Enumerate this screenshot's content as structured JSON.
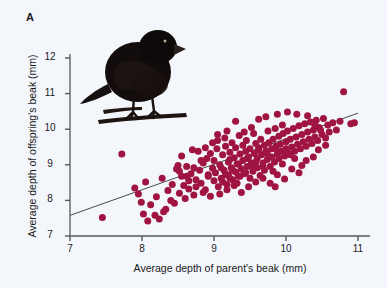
{
  "figure": {
    "panel_label": "A",
    "background_color": "#f3f6fa",
    "point_color": "#a01442",
    "line_color": "#4a4a52",
    "axis_color": "#58585f"
  },
  "photo": {
    "subject": "black darwins finch perched on branch",
    "alt": "Darwin's finch",
    "body_color": "#120d0c",
    "branch_color": "#1d1411"
  },
  "chart_data": {
    "type": "scatter",
    "title": "",
    "xlabel": "Average depth of parent's beak (mm)",
    "ylabel": "Average depth of offspring's beak (mm)",
    "xlim": [
      7,
      11
    ],
    "ylim": [
      7,
      12
    ],
    "xticks": [
      7,
      8,
      9,
      10,
      11
    ],
    "yticks": [
      7,
      8,
      9,
      10,
      11,
      12
    ],
    "xtick_labels": [
      "7",
      "8",
      "9",
      "10",
      "11"
    ],
    "ytick_labels": [
      "7",
      "8",
      "9",
      "10",
      "11",
      "12"
    ],
    "grid": false,
    "legend": null,
    "marker_size": 4.6,
    "trendline": {
      "type": "linear",
      "x": [
        7.0,
        11.0
      ],
      "y": [
        7.58,
        10.45
      ],
      "slope": 0.7175,
      "intercept": 2.5575
    },
    "points": [
      [
        7.45,
        7.52
      ],
      [
        7.72,
        9.3
      ],
      [
        7.9,
        8.35
      ],
      [
        7.95,
        8.18
      ],
      [
        7.99,
        7.95
      ],
      [
        8.02,
        7.62
      ],
      [
        8.05,
        8.52
      ],
      [
        8.08,
        7.42
      ],
      [
        8.12,
        7.88
      ],
      [
        8.18,
        7.58
      ],
      [
        8.2,
        8.1
      ],
      [
        8.24,
        7.48
      ],
      [
        8.28,
        8.62
      ],
      [
        8.3,
        7.68
      ],
      [
        8.33,
        7.75
      ],
      [
        8.36,
        8.28
      ],
      [
        8.4,
        8.0
      ],
      [
        8.42,
        8.45
      ],
      [
        8.45,
        7.92
      ],
      [
        8.48,
        8.88
      ],
      [
        8.5,
        8.98
      ],
      [
        8.52,
        8.2
      ],
      [
        8.55,
        9.25
      ],
      [
        8.58,
        8.42
      ],
      [
        8.6,
        8.05
      ],
      [
        8.62,
        8.95
      ],
      [
        8.65,
        8.32
      ],
      [
        8.68,
        8.75
      ],
      [
        8.7,
        9.42
      ],
      [
        8.72,
        8.15
      ],
      [
        8.75,
        8.58
      ],
      [
        8.78,
        9.38
      ],
      [
        8.8,
        8.85
      ],
      [
        8.82,
        8.48
      ],
      [
        8.85,
        9.05
      ],
      [
        8.88,
        8.3
      ],
      [
        8.9,
        9.18
      ],
      [
        8.92,
        8.68
      ],
      [
        8.95,
        9.32
      ],
      [
        8.98,
        8.9
      ],
      [
        9.0,
        8.55
      ],
      [
        9.0,
        9.12
      ],
      [
        9.02,
        8.78
      ],
      [
        9.04,
        9.45
      ],
      [
        9.06,
        8.38
      ],
      [
        9.08,
        9.0
      ],
      [
        9.1,
        8.62
      ],
      [
        9.12,
        9.28
      ],
      [
        9.14,
        8.85
      ],
      [
        9.16,
        9.52
      ],
      [
        9.18,
        8.45
      ],
      [
        9.2,
        9.08
      ],
      [
        9.2,
        8.72
      ],
      [
        9.22,
        9.35
      ],
      [
        9.24,
        8.92
      ],
      [
        9.26,
        8.58
      ],
      [
        9.28,
        9.2
      ],
      [
        9.3,
        8.8
      ],
      [
        9.3,
        9.48
      ],
      [
        9.32,
        9.02
      ],
      [
        9.34,
        8.68
      ],
      [
        9.36,
        9.3
      ],
      [
        9.38,
        8.88
      ],
      [
        9.4,
        9.55
      ],
      [
        9.4,
        9.12
      ],
      [
        9.42,
        8.75
      ],
      [
        9.44,
        9.38
      ],
      [
        9.46,
        8.95
      ],
      [
        9.48,
        9.22
      ],
      [
        9.5,
        8.62
      ],
      [
        9.5,
        9.45
      ],
      [
        9.52,
        9.05
      ],
      [
        9.54,
        8.82
      ],
      [
        9.56,
        9.32
      ],
      [
        9.58,
        9.6
      ],
      [
        9.6,
        8.92
      ],
      [
        9.6,
        9.18
      ],
      [
        9.62,
        9.48
      ],
      [
        9.64,
        8.7
      ],
      [
        9.66,
        9.28
      ],
      [
        9.68,
        9.05
      ],
      [
        9.7,
        9.55
      ],
      [
        9.7,
        8.85
      ],
      [
        9.72,
        9.38
      ],
      [
        9.74,
        9.15
      ],
      [
        9.76,
        9.62
      ],
      [
        9.78,
        8.95
      ],
      [
        9.8,
        9.45
      ],
      [
        9.8,
        9.22
      ],
      [
        9.82,
        9.72
      ],
      [
        9.84,
        9.08
      ],
      [
        9.86,
        9.52
      ],
      [
        9.88,
        9.3
      ],
      [
        9.9,
        9.8
      ],
      [
        9.9,
        9.18
      ],
      [
        9.92,
        9.58
      ],
      [
        9.94,
        9.38
      ],
      [
        9.96,
        9.88
      ],
      [
        9.98,
        9.25
      ],
      [
        10.0,
        9.65
      ],
      [
        10.0,
        9.45
      ],
      [
        10.02,
        9.95
      ],
      [
        10.04,
        9.32
      ],
      [
        10.06,
        9.72
      ],
      [
        10.08,
        9.5
      ],
      [
        10.1,
        10.02
      ],
      [
        10.12,
        9.38
      ],
      [
        10.14,
        9.78
      ],
      [
        10.16,
        9.58
      ],
      [
        10.18,
        10.1
      ],
      [
        10.2,
        9.45
      ],
      [
        10.22,
        9.85
      ],
      [
        10.24,
        9.65
      ],
      [
        10.26,
        10.15
      ],
      [
        10.28,
        9.52
      ],
      [
        10.3,
        9.92
      ],
      [
        10.32,
        9.72
      ],
      [
        10.34,
        10.2
      ],
      [
        10.36,
        9.6
      ],
      [
        10.38,
        9.98
      ],
      [
        10.4,
        9.78
      ],
      [
        10.42,
        10.25
      ],
      [
        10.44,
        9.68
      ],
      [
        10.46,
        10.05
      ],
      [
        10.5,
        9.85
      ],
      [
        10.52,
        10.3
      ],
      [
        10.55,
        9.75
      ],
      [
        10.58,
        10.12
      ],
      [
        10.6,
        9.92
      ],
      [
        10.65,
        10.18
      ],
      [
        10.7,
        9.98
      ],
      [
        10.75,
        10.22
      ],
      [
        10.8,
        11.05
      ],
      [
        10.9,
        10.15
      ],
      [
        10.95,
        10.18
      ],
      [
        9.05,
        9.68
      ],
      [
        9.15,
        9.75
      ],
      [
        9.25,
        9.62
      ],
      [
        9.35,
        9.82
      ],
      [
        9.45,
        9.68
      ],
      [
        9.55,
        9.88
      ],
      [
        9.65,
        9.72
      ],
      [
        9.75,
        9.95
      ],
      [
        9.85,
        10.02
      ],
      [
        9.95,
        10.12
      ],
      [
        9.08,
        8.18
      ],
      [
        9.18,
        8.3
      ],
      [
        9.28,
        8.42
      ],
      [
        9.38,
        8.22
      ],
      [
        9.48,
        8.38
      ],
      [
        9.58,
        8.52
      ],
      [
        9.68,
        8.62
      ],
      [
        9.78,
        8.48
      ],
      [
        9.88,
        8.72
      ],
      [
        9.98,
        8.6
      ],
      [
        10.08,
        8.88
      ],
      [
        10.18,
        8.78
      ],
      [
        9.12,
        8.52
      ],
      [
        9.22,
        8.62
      ],
      [
        9.32,
        8.48
      ],
      [
        8.95,
        8.12
      ],
      [
        8.85,
        8.22
      ],
      [
        8.75,
        8.38
      ],
      [
        8.65,
        8.55
      ],
      [
        8.55,
        8.68
      ],
      [
        10.28,
        9.12
      ],
      [
        10.38,
        9.22
      ],
      [
        9.85,
        8.38
      ],
      [
        10.45,
        9.42
      ],
      [
        10.55,
        9.55
      ],
      [
        9.42,
        9.92
      ],
      [
        9.52,
        10.05
      ],
      [
        9.62,
        10.28
      ],
      [
        9.72,
        10.35
      ],
      [
        9.88,
        10.42
      ],
      [
        10.02,
        10.48
      ],
      [
        10.15,
        10.42
      ],
      [
        10.3,
        10.38
      ],
      [
        10.4,
        10.12
      ],
      [
        10.48,
        9.98
      ],
      [
        9.3,
        10.22
      ],
      [
        9.18,
        9.95
      ],
      [
        8.98,
        9.62
      ],
      [
        9.05,
        9.85
      ],
      [
        8.88,
        9.48
      ],
      [
        10.22,
        8.98
      ],
      [
        10.12,
        9.18
      ],
      [
        9.95,
        9.02
      ],
      [
        9.82,
        8.82
      ],
      [
        9.68,
        8.95
      ],
      [
        9.1,
        8.92
      ],
      [
        9.22,
        9.15
      ],
      [
        9.34,
        9.02
      ],
      [
        9.46,
        9.18
      ],
      [
        9.58,
        9.08
      ],
      [
        9.16,
        8.72
      ],
      [
        9.26,
        8.85
      ],
      [
        9.36,
        8.68
      ],
      [
        9.44,
        8.78
      ],
      [
        9.54,
        8.92
      ],
      [
        8.52,
        8.82
      ],
      [
        8.62,
        8.68
      ],
      [
        8.72,
        8.92
      ],
      [
        8.82,
        9.12
      ],
      [
        8.92,
        8.72
      ],
      [
        9.62,
        9.42
      ],
      [
        9.74,
        9.32
      ],
      [
        9.86,
        9.45
      ],
      [
        9.98,
        9.38
      ],
      [
        10.06,
        9.28
      ]
    ]
  }
}
